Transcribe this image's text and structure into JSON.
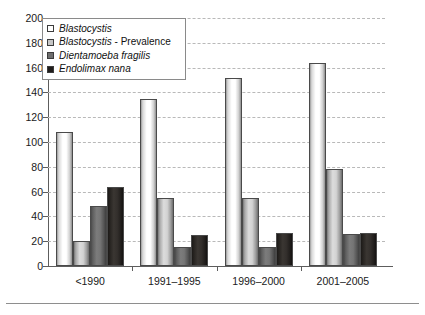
{
  "chart_data": {
    "type": "bar",
    "title": "",
    "subtitle": "",
    "xlabel": "",
    "ylabel": "",
    "ylim": [
      0,
      200
    ],
    "ytick_step": 20,
    "yticks": [
      0,
      20,
      40,
      60,
      80,
      100,
      120,
      140,
      160,
      180,
      200
    ],
    "grid": true,
    "grid_style": "dashed-horizontal",
    "legend_position": "top-left-inside",
    "categories": [
      "<1990",
      "1991–1995",
      "1996–2000",
      "2001–2005"
    ],
    "series": [
      {
        "name": "Blastocystis",
        "italic": true,
        "color": "#ffffff",
        "values": [
          108,
          135,
          152,
          164
        ]
      },
      {
        "name": "Blastocystis - Prevalence",
        "italic": true,
        "color": "#c6c6c6",
        "values": [
          20,
          55,
          55,
          78
        ]
      },
      {
        "name": "Dientamoeba fragilis",
        "italic": true,
        "color": "#6e6e6e",
        "values": [
          48,
          15,
          15,
          26
        ]
      },
      {
        "name": "Endolimax nana",
        "italic": true,
        "color": "#201d1b",
        "values": [
          64,
          25,
          27,
          27
        ]
      }
    ]
  },
  "legend": {
    "items": [
      {
        "label": "Blastocystis",
        "label_italic": "Blastocystis",
        "label_roman": ""
      },
      {
        "label": "Blastocystis - Prevalence",
        "label_italic": "Blastocystis",
        "label_roman": " - Prevalence"
      },
      {
        "label": "Dientamoeba fragilis",
        "label_italic": "Dientamoeba fragilis",
        "label_roman": ""
      },
      {
        "label": "Endolimax nana",
        "label_italic": "Endolimax nana",
        "label_roman": ""
      }
    ]
  },
  "axis": {
    "y_tick_labels": [
      "200",
      "180",
      "160",
      "140",
      "120",
      "100",
      "80",
      "60",
      "40",
      "20",
      "0"
    ],
    "x_tick_labels": [
      "<1990",
      "1991–1995",
      "1996–2000",
      "2001–2005"
    ]
  }
}
